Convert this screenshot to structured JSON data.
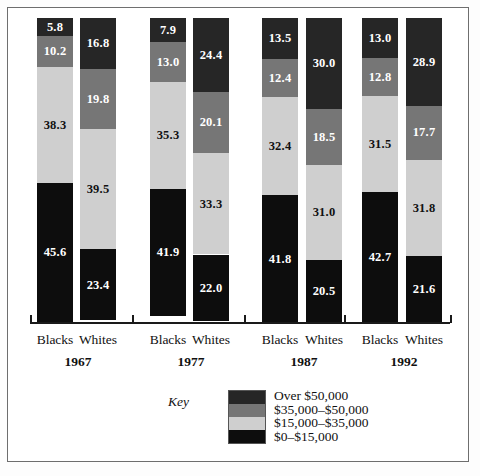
{
  "chart_data": {
    "type": "bar",
    "title": "",
    "subtitle": "",
    "xlabel": "",
    "ylabel": "",
    "ylim": [
      0,
      100
    ],
    "grid": false,
    "stacked": true,
    "stack_order": "bottom-to-top",
    "legend_position": "bottom-right",
    "legend_title": "Key",
    "categories": [
      "Blacks 1967",
      "Whites 1967",
      "Blacks 1977",
      "Whites 1977",
      "Blacks 1987",
      "Whites 1987",
      "Blacks 1992",
      "Whites 1992"
    ],
    "groups": [
      {
        "year": "1967",
        "races": [
          "Blacks",
          "Whites"
        ]
      },
      {
        "year": "1977",
        "races": [
          "Blacks",
          "Whites"
        ]
      },
      {
        "year": "1987",
        "races": [
          "Blacks",
          "Whites"
        ]
      },
      {
        "year": "1992",
        "races": [
          "Blacks",
          "Whites"
        ]
      }
    ],
    "series": [
      {
        "name": "$0–$15,000",
        "color": "#0d0d0d",
        "values": [
          45.6,
          23.4,
          41.9,
          22.0,
          41.8,
          20.5,
          42.7,
          21.6
        ]
      },
      {
        "name": "$15,000–$35,000",
        "color": "#cfcfcf",
        "values": [
          38.3,
          39.5,
          35.3,
          33.3,
          32.4,
          31.0,
          31.5,
          31.8
        ]
      },
      {
        "name": "$35,000–$50,000",
        "color": "#767676",
        "values": [
          10.2,
          19.8,
          13.0,
          20.1,
          12.4,
          18.5,
          12.8,
          17.7
        ]
      },
      {
        "name": "Over $50,000",
        "color": "#262626",
        "values": [
          5.8,
          16.8,
          7.9,
          24.4,
          13.5,
          30.0,
          13.0,
          28.9
        ]
      }
    ],
    "legend_entries": [
      {
        "label": "Over $50,000",
        "color": "#262626"
      },
      {
        "label": "$35,000–$50,000",
        "color": "#767676"
      },
      {
        "label": "$15,000–$35,000",
        "color": "#cfcfcf"
      },
      {
        "label": "$0–$15,000",
        "color": "#0d0d0d"
      }
    ]
  },
  "bars": [
    {
      "name": "Blacks",
      "year": "1967",
      "x": 37,
      "segments": [
        {
          "label": "5.8",
          "value": 5.8,
          "color": "#262626",
          "text": "#ffffff"
        },
        {
          "label": "10.2",
          "value": 10.2,
          "color": "#767676",
          "text": "#ffffff"
        },
        {
          "label": "38.3",
          "value": 38.3,
          "color": "#cfcfcf",
          "text": "#111111"
        },
        {
          "label": "45.6",
          "value": 45.6,
          "color": "#0d0d0d",
          "text": "#ffffff"
        }
      ]
    },
    {
      "name": "Whites",
      "year": "1967",
      "x": 80,
      "segments": [
        {
          "label": "16.8",
          "value": 16.8,
          "color": "#262626",
          "text": "#ffffff"
        },
        {
          "label": "19.8",
          "value": 19.8,
          "color": "#767676",
          "text": "#ffffff"
        },
        {
          "label": "39.5",
          "value": 39.5,
          "color": "#cfcfcf",
          "text": "#111111"
        },
        {
          "label": "23.4",
          "value": 23.4,
          "color": "#0d0d0d",
          "text": "#ffffff"
        }
      ]
    },
    {
      "name": "Blacks",
      "year": "1977",
      "x": 150,
      "segments": [
        {
          "label": "7.9",
          "value": 7.9,
          "color": "#262626",
          "text": "#ffffff"
        },
        {
          "label": "13.0",
          "value": 13.0,
          "color": "#767676",
          "text": "#ffffff"
        },
        {
          "label": "35.3",
          "value": 35.3,
          "color": "#cfcfcf",
          "text": "#111111"
        },
        {
          "label": "41.9",
          "value": 41.9,
          "color": "#0d0d0d",
          "text": "#ffffff"
        }
      ]
    },
    {
      "name": "Whites",
      "year": "1977",
      "x": 193,
      "segments": [
        {
          "label": "24.4",
          "value": 24.4,
          "color": "#262626",
          "text": "#ffffff"
        },
        {
          "label": "20.1",
          "value": 20.1,
          "color": "#767676",
          "text": "#ffffff"
        },
        {
          "label": "33.3",
          "value": 33.3,
          "color": "#cfcfcf",
          "text": "#111111"
        },
        {
          "label": "22.0",
          "value": 22.0,
          "color": "#0d0d0d",
          "text": "#ffffff"
        }
      ]
    },
    {
      "name": "Blacks",
      "year": "1987",
      "x": 262,
      "segments": [
        {
          "label": "13.5",
          "value": 13.5,
          "color": "#262626",
          "text": "#ffffff"
        },
        {
          "label": "12.4",
          "value": 12.4,
          "color": "#767676",
          "text": "#ffffff"
        },
        {
          "label": "32.4",
          "value": 32.4,
          "color": "#cfcfcf",
          "text": "#111111"
        },
        {
          "label": "41.8",
          "value": 41.8,
          "color": "#0d0d0d",
          "text": "#ffffff"
        }
      ]
    },
    {
      "name": "Whites",
      "year": "1987",
      "x": 306,
      "segments": [
        {
          "label": "30.0",
          "value": 30.0,
          "color": "#262626",
          "text": "#ffffff"
        },
        {
          "label": "18.5",
          "value": 18.5,
          "color": "#767676",
          "text": "#ffffff"
        },
        {
          "label": "31.0",
          "value": 31.0,
          "color": "#cfcfcf",
          "text": "#111111"
        },
        {
          "label": "20.5",
          "value": 20.5,
          "color": "#0d0d0d",
          "text": "#ffffff"
        }
      ]
    },
    {
      "name": "Blacks",
      "year": "1992",
      "x": 362,
      "segments": [
        {
          "label": "13.0",
          "value": 13.0,
          "color": "#262626",
          "text": "#ffffff"
        },
        {
          "label": "12.8",
          "value": 12.8,
          "color": "#767676",
          "text": "#ffffff"
        },
        {
          "label": "31.5",
          "value": 31.5,
          "color": "#cfcfcf",
          "text": "#111111"
        },
        {
          "label": "42.7",
          "value": 42.7,
          "color": "#0d0d0d",
          "text": "#ffffff"
        }
      ]
    },
    {
      "name": "Whites",
      "year": "1992",
      "x": 406,
      "segments": [
        {
          "label": "28.9",
          "value": 28.9,
          "color": "#262626",
          "text": "#ffffff"
        },
        {
          "label": "17.7",
          "value": 17.7,
          "color": "#767676",
          "text": "#ffffff"
        },
        {
          "label": "31.8",
          "value": 31.8,
          "color": "#cfcfcf",
          "text": "#111111"
        },
        {
          "label": "21.6",
          "value": 21.6,
          "color": "#0d0d0d",
          "text": "#ffffff"
        }
      ]
    }
  ],
  "axis": {
    "ticks_x": [
      30,
      132,
      244,
      344,
      450
    ]
  },
  "labels": {
    "categories": [
      {
        "text": "Blacks",
        "x": 37
      },
      {
        "text": "Whites",
        "x": 80
      },
      {
        "text": "Blacks",
        "x": 150
      },
      {
        "text": "Whites",
        "x": 193
      },
      {
        "text": "Blacks",
        "x": 262
      },
      {
        "text": "Whites",
        "x": 306
      },
      {
        "text": "Blacks",
        "x": 362
      },
      {
        "text": "Whites",
        "x": 406
      }
    ],
    "years": [
      {
        "text": "1967",
        "x": 18
      },
      {
        "text": "1977",
        "x": 131
      },
      {
        "text": "1987",
        "x": 244
      },
      {
        "text": "1992",
        "x": 344
      }
    ]
  },
  "legend": {
    "key_label": "Key",
    "entries": [
      {
        "label": "Over $50,000",
        "color": "#262626"
      },
      {
        "label": "$35,000–$50,000",
        "color": "#767676"
      },
      {
        "label": "$15,000–$35,000",
        "color": "#cfcfcf"
      },
      {
        "label": "$0–$15,000",
        "color": "#0d0d0d"
      }
    ]
  },
  "geometry": {
    "bar_top": 18,
    "bar_bottom": 322,
    "bar_width": 36
  }
}
